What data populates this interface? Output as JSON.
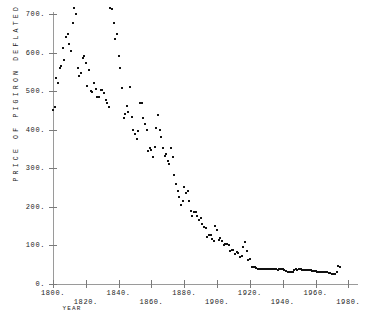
{
  "chart_data": {
    "type": "scatter",
    "title": "",
    "xlabel": "YEAR",
    "ylabel": "PRICE OF PIGIRON DEFLATED BY WAGE",
    "xlim": [
      1795,
      1985
    ],
    "ylim": [
      0,
      730
    ],
    "grid": false,
    "legend": null,
    "xticks": [
      1800,
      1820,
      1840,
      1860,
      1880,
      1900,
      1920,
      1940,
      1960,
      1980
    ],
    "xticklabels": [
      "1800.",
      "1820.",
      "1840.",
      "1860.",
      "1880.",
      "1900.",
      "1920.",
      "1940.",
      "1960.",
      "1980."
    ],
    "yticks": [
      0,
      100,
      200,
      300,
      400,
      500,
      600,
      700
    ],
    "yticklabels": [
      "0.",
      "100.",
      "200.",
      "300.",
      "400.",
      "500.",
      "600.",
      "700."
    ],
    "marker_color": "#111111",
    "axis_color": "#9a9a9a",
    "points": [
      [
        1800.0,
        452.0
      ],
      [
        1801.0,
        460.0
      ],
      [
        1802.0,
        534.0
      ],
      [
        1803.0,
        520.0
      ],
      [
        1804.0,
        560.0
      ],
      [
        1805.0,
        566.0
      ],
      [
        1806.0,
        612.0
      ],
      [
        1807.0,
        580.0
      ],
      [
        1808.0,
        640.0
      ],
      [
        1809.0,
        648.0
      ],
      [
        1810.0,
        622.0
      ],
      [
        1811.0,
        604.0
      ],
      [
        1812.0,
        676.0
      ],
      [
        1813.0,
        716.0
      ],
      [
        1814.0,
        700.0
      ],
      [
        1815.0,
        560.0
      ],
      [
        1816.0,
        540.0
      ],
      [
        1817.0,
        548.0
      ],
      [
        1818.0,
        586.0
      ],
      [
        1819.0,
        592.0
      ],
      [
        1820.0,
        572.0
      ],
      [
        1821.0,
        514.0
      ],
      [
        1822.0,
        556.0
      ],
      [
        1823.0,
        500.0
      ],
      [
        1824.0,
        498.0
      ],
      [
        1825.0,
        520.0
      ],
      [
        1826.0,
        506.0
      ],
      [
        1827.0,
        486.0
      ],
      [
        1828.0,
        484.0
      ],
      [
        1829.0,
        504.0
      ],
      [
        1830.0,
        502.0
      ],
      [
        1831.0,
        494.0
      ],
      [
        1832.0,
        478.0
      ],
      [
        1833.0,
        470.0
      ],
      [
        1834.0,
        458.0
      ],
      [
        1835.0,
        716.0
      ],
      [
        1836.0,
        712.0
      ],
      [
        1837.0,
        676.0
      ],
      [
        1838.0,
        636.0
      ],
      [
        1839.0,
        648.0
      ],
      [
        1840.0,
        592.0
      ],
      [
        1841.0,
        560.0
      ],
      [
        1842.0,
        508.0
      ],
      [
        1843.0,
        430.0
      ],
      [
        1844.0,
        440.0
      ],
      [
        1845.0,
        462.0
      ],
      [
        1846.0,
        446.0
      ],
      [
        1847.0,
        510.0
      ],
      [
        1848.0,
        432.0
      ],
      [
        1849.0,
        398.0
      ],
      [
        1850.0,
        388.0
      ],
      [
        1851.0,
        376.0
      ],
      [
        1852.0,
        396.0
      ],
      [
        1853.0,
        468.0
      ],
      [
        1854.0,
        470.0
      ],
      [
        1855.0,
        430.0
      ],
      [
        1856.0,
        414.0
      ],
      [
        1857.0,
        400.0
      ],
      [
        1858.0,
        344.0
      ],
      [
        1859.0,
        352.0
      ],
      [
        1860.0,
        348.0
      ],
      [
        1861.0,
        330.0
      ],
      [
        1862.0,
        356.0
      ],
      [
        1863.0,
        404.0
      ],
      [
        1864.0,
        438.0
      ],
      [
        1865.0,
        398.0
      ],
      [
        1866.0,
        382.0
      ],
      [
        1867.0,
        352.0
      ],
      [
        1868.0,
        332.0
      ],
      [
        1869.0,
        338.0
      ],
      [
        1870.0,
        320.0
      ],
      [
        1871.0,
        312.0
      ],
      [
        1872.0,
        352.0
      ],
      [
        1873.0,
        330.0
      ],
      [
        1874.0,
        282.0
      ],
      [
        1875.0,
        260.0
      ],
      [
        1876.0,
        240.0
      ],
      [
        1877.0,
        226.0
      ],
      [
        1878.0,
        206.0
      ],
      [
        1879.0,
        216.0
      ],
      [
        1880.0,
        252.0
      ],
      [
        1881.0,
        236.0
      ],
      [
        1882.0,
        242.0
      ],
      [
        1883.0,
        214.0
      ],
      [
        1884.0,
        190.0
      ],
      [
        1885.0,
        176.0
      ],
      [
        1886.0,
        186.0
      ],
      [
        1887.0,
        186.0
      ],
      [
        1888.0,
        176.0
      ],
      [
        1889.0,
        166.0
      ],
      [
        1890.0,
        172.0
      ],
      [
        1891.0,
        156.0
      ],
      [
        1892.0,
        148.0
      ],
      [
        1893.0,
        144.0
      ],
      [
        1894.0,
        122.0
      ],
      [
        1895.0,
        128.0
      ],
      [
        1896.0,
        126.0
      ],
      [
        1897.0,
        116.0
      ],
      [
        1898.0,
        112.0
      ],
      [
        1899.0,
        150.0
      ],
      [
        1900.0,
        140.0
      ],
      [
        1901.0,
        114.0
      ],
      [
        1902.0,
        118.0
      ],
      [
        1903.0,
        112.0
      ],
      [
        1904.0,
        100.0
      ],
      [
        1905.0,
        104.0
      ],
      [
        1906.0,
        104.0
      ],
      [
        1907.0,
        102.0
      ],
      [
        1908.0,
        86.0
      ],
      [
        1909.0,
        88.0
      ],
      [
        1910.0,
        88.0
      ],
      [
        1911.0,
        78.0
      ],
      [
        1912.0,
        82.0
      ],
      [
        1913.0,
        80.0
      ],
      [
        1914.0,
        70.0
      ],
      [
        1915.0,
        72.0
      ],
      [
        1916.0,
        96.0
      ],
      [
        1917.0,
        110.0
      ],
      [
        1918.0,
        86.0
      ],
      [
        1919.0,
        62.0
      ],
      [
        1920.0,
        64.0
      ],
      [
        1921.0,
        44.0
      ],
      [
        1922.0,
        44.0
      ],
      [
        1923.0,
        44.0
      ],
      [
        1924.0,
        42.0
      ],
      [
        1925.0,
        40.0
      ],
      [
        1926.0,
        40.0
      ],
      [
        1927.0,
        38.0
      ],
      [
        1928.0,
        38.0
      ],
      [
        1929.0,
        38.0
      ],
      [
        1930.0,
        38.0
      ],
      [
        1931.0,
        38.0
      ],
      [
        1932.0,
        40.0
      ],
      [
        1933.0,
        40.0
      ],
      [
        1934.0,
        38.0
      ],
      [
        1935.0,
        38.0
      ],
      [
        1936.0,
        38.0
      ],
      [
        1937.0,
        36.0
      ],
      [
        1938.0,
        38.0
      ],
      [
        1939.0,
        38.0
      ],
      [
        1940.0,
        38.0
      ],
      [
        1941.0,
        36.0
      ],
      [
        1942.0,
        34.0
      ],
      [
        1943.0,
        32.0
      ],
      [
        1944.0,
        30.0
      ],
      [
        1945.0,
        30.0
      ],
      [
        1946.0,
        32.0
      ],
      [
        1947.0,
        36.0
      ],
      [
        1948.0,
        38.0
      ],
      [
        1949.0,
        36.0
      ],
      [
        1950.0,
        38.0
      ],
      [
        1951.0,
        38.0
      ],
      [
        1952.0,
        36.0
      ],
      [
        1953.0,
        36.0
      ],
      [
        1954.0,
        36.0
      ],
      [
        1955.0,
        36.0
      ],
      [
        1956.0,
        36.0
      ],
      [
        1957.0,
        36.0
      ],
      [
        1958.0,
        34.0
      ],
      [
        1959.0,
        34.0
      ],
      [
        1960.0,
        34.0
      ],
      [
        1961.0,
        32.0
      ],
      [
        1962.0,
        32.0
      ],
      [
        1963.0,
        32.0
      ],
      [
        1964.0,
        32.0
      ],
      [
        1965.0,
        30.0
      ],
      [
        1966.0,
        30.0
      ],
      [
        1967.0,
        30.0
      ],
      [
        1968.0,
        28.0
      ],
      [
        1969.0,
        28.0
      ],
      [
        1970.0,
        26.0
      ],
      [
        1971.0,
        26.0
      ],
      [
        1972.0,
        26.0
      ],
      [
        1973.0,
        30.0
      ],
      [
        1974.0,
        46.0
      ],
      [
        1975.0,
        44.0
      ]
    ]
  }
}
